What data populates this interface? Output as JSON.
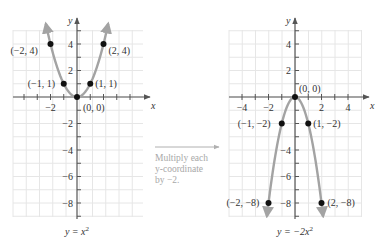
{
  "chart_data": [
    {
      "type": "line",
      "title": "",
      "caption": "y = x²",
      "equation": {
        "lhs": "y = ",
        "var": "x",
        "exp": "2"
      },
      "function": "y = x^2",
      "xlabel": "x",
      "ylabel": "y",
      "xlim": [
        -4.5,
        5
      ],
      "ylim": [
        -9,
        5
      ],
      "grid": true,
      "x_ticks": [
        -2
      ],
      "x_tick_labels": [
        "−2"
      ],
      "y_ticks": [
        4,
        2,
        -2,
        -4,
        -6,
        -8
      ],
      "y_tick_labels": [
        "4",
        "2",
        "−2",
        "−4",
        "−6",
        "−8"
      ],
      "points": [
        {
          "x": -2,
          "y": 4,
          "label": "(−2, 4)"
        },
        {
          "x": -1,
          "y": 1,
          "label": "(−1, 1)"
        },
        {
          "x": 0,
          "y": 0,
          "label": "(0, 0)"
        },
        {
          "x": 1,
          "y": 1,
          "label": "(1, 1)"
        },
        {
          "x": 2,
          "y": 4,
          "label": "(2, 4)"
        }
      ],
      "curve": {
        "a": 1,
        "x_range": [
          -2.35,
          2.35
        ],
        "color": "#a3a3a3"
      }
    },
    {
      "type": "line",
      "title": "",
      "caption": "y = −2x²",
      "equation": {
        "lhs": "y = −2",
        "var": "x",
        "exp": "2"
      },
      "function": "y = -2x^2",
      "xlabel": "x",
      "ylabel": "y",
      "xlim": [
        -5,
        5.5
      ],
      "ylim": [
        -9,
        5
      ],
      "grid": true,
      "x_ticks": [
        -4,
        -2,
        2,
        4
      ],
      "x_tick_labels": [
        "−4",
        "−2",
        "2",
        "4"
      ],
      "y_ticks": [
        4,
        2,
        -4,
        -6,
        -8
      ],
      "y_tick_labels": [
        "4",
        "2",
        "−4",
        "−6",
        "−8"
      ],
      "points": [
        {
          "x": -2,
          "y": -8,
          "label": "(−2, −8)"
        },
        {
          "x": -1,
          "y": -2,
          "label": "(−1, −2)"
        },
        {
          "x": 0,
          "y": 0,
          "label": "(0, 0)"
        },
        {
          "x": 1,
          "y": -2,
          "label": "(1, −2)"
        },
        {
          "x": 2,
          "y": -8,
          "label": "(2, −8)"
        }
      ],
      "curve": {
        "a": -2,
        "x_range": [
          -2.12,
          2.12
        ],
        "color": "#a3a3a3"
      }
    }
  ],
  "transform_note": {
    "lines": [
      "Multiply each",
      "y-coordinate",
      "by −2."
    ],
    "arrow_color": "#b0b0b0"
  },
  "colors": {
    "grid": "#e6e6e6",
    "axis": "#555555",
    "point": "#111111",
    "curve": "#a3a3a3"
  }
}
